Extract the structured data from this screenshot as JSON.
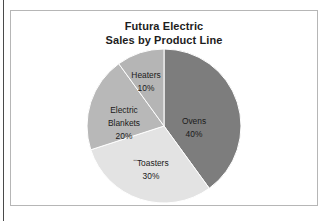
{
  "page": {
    "clipped_header_text": "",
    "frame_color": "#b6b6b6",
    "edge_rule_color": "#4a4a4a",
    "background": "#ffffff"
  },
  "chart_data": {
    "type": "pie",
    "title": "Futura Electric Sales by Product Line",
    "title_lines": [
      "Futura Electric",
      "Sales by Product Line"
    ],
    "xlabel": "",
    "ylabel": "",
    "legend": "none",
    "grid": false,
    "start_angle_deg": 0,
    "direction": "clockwise",
    "categories": [
      "Ovens",
      "Toasters",
      "Electric Blankets",
      "Heaters"
    ],
    "values": [
      40,
      30,
      20,
      10
    ],
    "units": "percent",
    "colors": [
      "#7d7d7d",
      "#e3e3e3",
      "#b8b8b8",
      "#b5b5b5"
    ],
    "slices": [
      {
        "label": "Ovens",
        "value": 40,
        "value_text": "40%",
        "color": "#7d7d7d",
        "label_lines": [
          "Ovens",
          "40%"
        ]
      },
      {
        "label": "Toasters",
        "value": 30,
        "value_text": "30%",
        "color": "#e3e3e3",
        "label_lines": [
          "Toasters",
          "30%"
        ],
        "label_prefix_artifact": "▪▪"
      },
      {
        "label": "Electric Blankets",
        "value": 20,
        "value_text": "20%",
        "color": "#b8b8b8",
        "label_lines": [
          "Electric",
          "Blankets",
          "20%"
        ]
      },
      {
        "label": "Heaters",
        "value": 10,
        "value_text": "10%",
        "color": "#b5b5b5",
        "label_lines": [
          "Heaters",
          "10%"
        ]
      }
    ]
  }
}
